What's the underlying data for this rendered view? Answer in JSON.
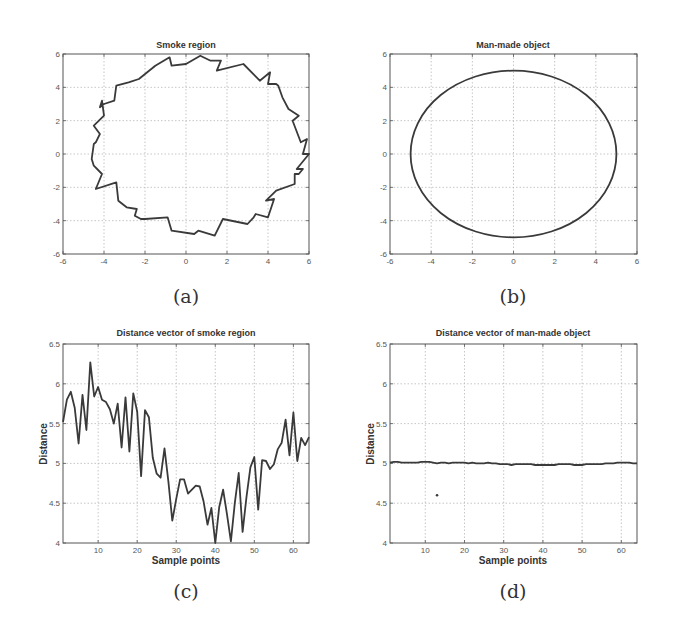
{
  "figure": {
    "captions": [
      "(a)",
      "(b)",
      "(c)",
      "(d)"
    ]
  },
  "colors": {
    "line": "#3a3a3a",
    "axis": "#555555",
    "grid": "#b8b8b8",
    "text": "#333333"
  },
  "chart_data": [
    {
      "id": "a",
      "type": "line",
      "title": "Smoke region",
      "xlabel": "",
      "ylabel": "",
      "xlim": [
        -6,
        6
      ],
      "ylim": [
        -6,
        6
      ],
      "xticks": [
        -6,
        -4,
        -2,
        0,
        2,
        4,
        6
      ],
      "yticks": [
        -6,
        -4,
        -2,
        0,
        2,
        4,
        6
      ],
      "grid": true,
      "box": {
        "left": 63,
        "top": 54,
        "right": 309,
        "bottom": 254
      },
      "caption": "(a)",
      "x": [
        5.9,
        5.6,
        5.2,
        5.5,
        5.0,
        4.7,
        4.5,
        4.4,
        4.0,
        4.1,
        3.6,
        2.8,
        1.5,
        1.7,
        1.2,
        0.7,
        0.0,
        -0.7,
        -0.8,
        -1.5,
        -2.3,
        -2.8,
        -3.4,
        -3.5,
        -4.0,
        -4.2,
        -4.1,
        -4.0,
        -4.5,
        -4.2,
        -4.4,
        -4.5,
        -4.6,
        -4.5,
        -4.1,
        -4.4,
        -3.4,
        -3.3,
        -2.9,
        -2.4,
        -2.5,
        -2.2,
        -2.0,
        -0.9,
        -0.7,
        0.4,
        0.6,
        1.4,
        1.8,
        3.0,
        3.3,
        3.4,
        4.0,
        4.3,
        3.9,
        4.4,
        5.3,
        5.3,
        5.5,
        5.7,
        5.4,
        6.0,
        5.7,
        5.9
      ],
      "y": [
        0.9,
        0.7,
        2.0,
        2.3,
        2.7,
        3.4,
        4.1,
        4.2,
        4.2,
        4.9,
        4.4,
        5.4,
        5.0,
        5.6,
        5.6,
        5.9,
        5.4,
        5.3,
        5.8,
        5.3,
        4.5,
        4.3,
        4.1,
        3.2,
        3.0,
        2.8,
        3.2,
        2.3,
        1.7,
        1.2,
        0.7,
        0.6,
        -0.3,
        -0.7,
        -1.2,
        -2.1,
        -1.7,
        -2.8,
        -3.2,
        -3.3,
        -3.7,
        -3.9,
        -3.9,
        -3.8,
        -4.6,
        -4.8,
        -4.6,
        -4.9,
        -3.9,
        -4.2,
        -3.8,
        -3.6,
        -3.8,
        -2.7,
        -2.8,
        -2.2,
        -1.8,
        -1.2,
        -1.2,
        -0.9,
        -0.9,
        0.0,
        0.0,
        0.9
      ]
    },
    {
      "id": "b",
      "type": "line",
      "title": "Man-made object",
      "xlabel": "",
      "ylabel": "",
      "xlim": [
        -6,
        6
      ],
      "ylim": [
        -6,
        6
      ],
      "xticks": [
        -6,
        -4,
        -2,
        0,
        2,
        4,
        6
      ],
      "yticks": [
        -6,
        -4,
        -2,
        0,
        2,
        4,
        6
      ],
      "grid": true,
      "box": {
        "left": 390,
        "top": 54,
        "right": 637,
        "bottom": 254
      },
      "caption": "(b)",
      "shape": "circle",
      "center": [
        0,
        0
      ],
      "radius": 5
    },
    {
      "id": "c",
      "type": "line",
      "title": "Distance vector of smoke region",
      "xlabel": "Sample points",
      "ylabel": "Distance",
      "xlim": [
        1,
        64
      ],
      "ylim": [
        4,
        6.5
      ],
      "xticks": [
        10,
        20,
        30,
        40,
        50,
        60
      ],
      "yticks": [
        4,
        4.5,
        5,
        5.5,
        6,
        6.5
      ],
      "grid": true,
      "box": {
        "left": 63,
        "top": 344,
        "right": 309,
        "bottom": 543
      },
      "caption": "(c)",
      "x": [
        1,
        2,
        3,
        4,
        5,
        6,
        7,
        8,
        9,
        10,
        11,
        12,
        13,
        14,
        15,
        16,
        17,
        18,
        19,
        20,
        21,
        22,
        23,
        24,
        25,
        26,
        27,
        28,
        29,
        30,
        31,
        32,
        33,
        34,
        35,
        36,
        37,
        38,
        39,
        40,
        41,
        42,
        43,
        44,
        45,
        46,
        47,
        48,
        49,
        50,
        51,
        52,
        53,
        54,
        55,
        56,
        57,
        58,
        59,
        60,
        61,
        62,
        63,
        64
      ],
      "values": [
        5.52,
        5.8,
        5.9,
        5.7,
        5.25,
        5.86,
        5.42,
        6.27,
        5.84,
        5.96,
        5.8,
        5.77,
        5.68,
        5.5,
        5.75,
        5.2,
        5.83,
        5.15,
        5.88,
        5.65,
        4.84,
        5.67,
        5.58,
        5.07,
        4.87,
        4.82,
        5.19,
        4.77,
        4.28,
        4.55,
        4.8,
        4.8,
        4.62,
        4.67,
        4.72,
        4.71,
        4.52,
        4.23,
        4.44,
        4.0,
        4.45,
        4.67,
        4.36,
        4.02,
        4.5,
        4.88,
        4.14,
        4.58,
        4.95,
        5.08,
        4.42,
        5.04,
        5.03,
        4.93,
        4.99,
        5.18,
        5.26,
        5.55,
        5.1,
        5.64,
        5.03,
        5.32,
        5.23,
        5.33
      ]
    },
    {
      "id": "d",
      "type": "line",
      "title": "Distance vector of man-made object",
      "xlabel": "Sample points",
      "ylabel": "Distance",
      "xlim": [
        1,
        64
      ],
      "ylim": [
        4,
        6.5
      ],
      "xticks": [
        10,
        20,
        30,
        40,
        50,
        60
      ],
      "yticks": [
        4,
        4.5,
        5,
        5.5,
        6,
        6.5
      ],
      "grid": true,
      "box": {
        "left": 390,
        "top": 344,
        "right": 637,
        "bottom": 543
      },
      "caption": "(d)",
      "x": [
        1,
        2,
        3,
        4,
        5,
        6,
        7,
        8,
        9,
        10,
        11,
        12,
        13,
        14,
        15,
        16,
        17,
        18,
        19,
        20,
        21,
        22,
        23,
        24,
        25,
        26,
        27,
        28,
        29,
        30,
        31,
        32,
        33,
        34,
        35,
        36,
        37,
        38,
        39,
        40,
        41,
        42,
        43,
        44,
        45,
        46,
        47,
        48,
        49,
        50,
        51,
        52,
        53,
        54,
        55,
        56,
        57,
        58,
        59,
        60,
        61,
        62,
        63,
        64
      ],
      "values": [
        5.01,
        5.02,
        5.02,
        5.01,
        5.01,
        5.01,
        5.01,
        5.01,
        5.02,
        5.02,
        5.02,
        5.01,
        5.0,
        5.01,
        5.01,
        5.0,
        5.01,
        5.01,
        5.01,
        5.01,
        5.0,
        5.01,
        5.0,
        5.0,
        5.0,
        5.01,
        5.0,
        5.0,
        4.99,
        4.99,
        4.99,
        4.98,
        4.99,
        4.99,
        4.99,
        4.99,
        4.99,
        4.98,
        4.98,
        4.98,
        4.98,
        4.98,
        4.98,
        4.99,
        4.99,
        4.99,
        4.99,
        4.98,
        4.98,
        4.98,
        4.99,
        4.99,
        4.99,
        4.99,
        4.99,
        5.0,
        5.0,
        5.0,
        5.01,
        5.01,
        5.01,
        5.01,
        5.0,
        5.0
      ],
      "annotations": [
        {
          "type": "dot",
          "x": 13,
          "y": 4.6
        }
      ]
    }
  ]
}
